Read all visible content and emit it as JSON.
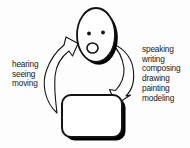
{
  "diagram": {
    "title_hint": "communication cycle between a person and a medium",
    "colors": {
      "background": "#fdfdfd",
      "ink": "#141414",
      "fill": "#ffffff",
      "shadow": "#000000"
    },
    "left_labels": {
      "0": "hearing",
      "1": "seeing",
      "2": "moving"
    },
    "right_labels": {
      "0": "speaking",
      "1": "writing",
      "2": "composing",
      "3": "drawing",
      "4": "painting",
      "5": "modeling"
    },
    "icons": {
      "head": "face-with-open-mouth-icon",
      "medium": "rounded-box-icon",
      "up_arrow": "curved-up-arrow-icon",
      "down_arrow": "curved-down-arrow-icon"
    }
  }
}
